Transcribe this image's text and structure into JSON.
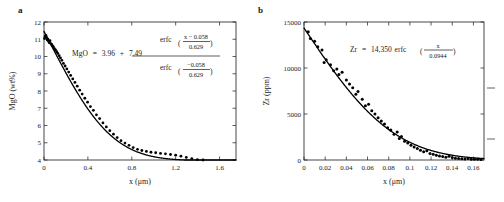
{
  "figure": {
    "background": "#ffffff",
    "foreground": "#1a1a1a"
  },
  "panels": [
    {
      "label": "a",
      "equation": {
        "lhs": "MgO",
        "equals": "=",
        "intercept": "3.96",
        "plus": "+",
        "amplitude": "7.49",
        "numerator_fn": "erfc",
        "numerator_top": "x − 0.058",
        "numerator_bottom": "0.629",
        "denominator_fn": "erfc",
        "denominator_top": "−0.058",
        "denominator_bottom": "0.629"
      }
    },
    {
      "label": "b",
      "equation": {
        "lhs": "Zr",
        "equals": "=",
        "amplitude": "14,350",
        "fn": "erfc",
        "numerator_top": "x",
        "numerator_bottom": "0.0944"
      }
    }
  ],
  "chart_data": [
    {
      "type": "scatter",
      "panel": "a",
      "title": "",
      "xlabel": "x (μm)",
      "ylabel": "MgO (wt%)",
      "xlim": [
        0,
        1.75
      ],
      "ylim": [
        4,
        12
      ],
      "xticks": [
        0,
        0.4,
        0.8,
        1.2,
        1.6
      ],
      "xticklabels": [
        "0",
        "0.4",
        "0.8",
        "1.2",
        "1.6"
      ],
      "yticks": [
        4,
        5,
        6,
        7,
        8,
        9,
        10,
        11,
        12
      ],
      "yticklabels": [
        "4",
        "5",
        "6",
        "7",
        "8",
        "9",
        "10",
        "11",
        "12"
      ],
      "grid": false,
      "legend": null,
      "annotation": "MgO = 3.96 + 7.49 erfc((x − 0.058)/0.629) / erfc(−0.058/0.629)",
      "fit": {
        "model": "erfc",
        "baseline": 3.96,
        "amplitude": 7.49,
        "x0": 0.058,
        "length_scale": 0.629
      },
      "points": [
        [
          0.005,
          11.05
        ],
        [
          0.012,
          11.18
        ],
        [
          0.018,
          11.22
        ],
        [
          0.024,
          11.1
        ],
        [
          0.03,
          10.95
        ],
        [
          0.036,
          11.0
        ],
        [
          0.042,
          10.88
        ],
        [
          0.048,
          10.8
        ],
        [
          0.055,
          10.92
        ],
        [
          0.062,
          10.75
        ],
        [
          0.07,
          10.7
        ],
        [
          0.078,
          10.62
        ],
        [
          0.086,
          10.55
        ],
        [
          0.095,
          10.45
        ],
        [
          0.105,
          10.38
        ],
        [
          0.115,
          10.28
        ],
        [
          0.126,
          10.18
        ],
        [
          0.138,
          10.05
        ],
        [
          0.15,
          9.92
        ],
        [
          0.163,
          9.78
        ],
        [
          0.177,
          9.6
        ],
        [
          0.192,
          9.45
        ],
        [
          0.208,
          9.28
        ],
        [
          0.225,
          9.1
        ],
        [
          0.243,
          8.9
        ],
        [
          0.262,
          8.7
        ],
        [
          0.282,
          8.5
        ],
        [
          0.303,
          8.28
        ],
        [
          0.325,
          8.05
        ],
        [
          0.348,
          7.82
        ],
        [
          0.372,
          7.58
        ],
        [
          0.397,
          7.35
        ],
        [
          0.423,
          7.1
        ],
        [
          0.45,
          6.88
        ],
        [
          0.478,
          6.62
        ],
        [
          0.507,
          6.4
        ],
        [
          0.537,
          6.15
        ],
        [
          0.568,
          5.92
        ],
        [
          0.6,
          5.7
        ],
        [
          0.633,
          5.5
        ],
        [
          0.667,
          5.3
        ],
        [
          0.702,
          5.12
        ],
        [
          0.738,
          4.98
        ],
        [
          0.775,
          4.85
        ],
        [
          0.813,
          4.72
        ],
        [
          0.852,
          4.62
        ],
        [
          0.892,
          4.55
        ],
        [
          0.933,
          4.5
        ],
        [
          0.975,
          4.45
        ],
        [
          1.018,
          4.42
        ],
        [
          1.062,
          4.38
        ],
        [
          1.107,
          4.36
        ],
        [
          1.153,
          4.32
        ],
        [
          1.2,
          4.28
        ],
        [
          1.248,
          4.22
        ],
        [
          1.297,
          4.15
        ],
        [
          1.347,
          4.08
        ],
        [
          1.398,
          4.02
        ],
        [
          1.45,
          4.0
        ],
        [
          1.503,
          3.97
        ],
        [
          1.557,
          3.96
        ],
        [
          1.612,
          3.94
        ],
        [
          1.668,
          3.93
        ]
      ]
    },
    {
      "type": "scatter",
      "panel": "b",
      "title": "",
      "xlabel": "x (μm)",
      "ylabel": "Zr (ppm)",
      "xlim": [
        0,
        0.17
      ],
      "ylim": [
        0,
        15000
      ],
      "xticks": [
        0,
        0.02,
        0.04,
        0.06,
        0.08,
        0.1,
        0.12,
        0.14,
        0.16
      ],
      "xticklabels": [
        "0",
        "0.02",
        "0.04",
        "0.06",
        "0.08",
        "0.1",
        "0.12",
        "0.14",
        "0.16"
      ],
      "yticks": [
        0,
        5000,
        10000,
        15000
      ],
      "yticklabels": [
        "0",
        "5000",
        "10000",
        "15000"
      ],
      "grid": false,
      "legend": null,
      "annotation": "Zr = 14,350 erfc(x/0.0944)",
      "fit": {
        "model": "erfc",
        "baseline": 0,
        "amplitude": 14350,
        "x0": 0,
        "length_scale": 0.0944
      },
      "points": [
        [
          0.004,
          13950
        ],
        [
          0.006,
          13200
        ],
        [
          0.01,
          12900
        ],
        [
          0.013,
          12300
        ],
        [
          0.017,
          11950
        ],
        [
          0.019,
          10600
        ],
        [
          0.021,
          10900
        ],
        [
          0.025,
          10350
        ],
        [
          0.028,
          9700
        ],
        [
          0.031,
          9900
        ],
        [
          0.033,
          9300
        ],
        [
          0.036,
          9550
        ],
        [
          0.04,
          8700
        ],
        [
          0.043,
          8250
        ],
        [
          0.046,
          7850
        ],
        [
          0.049,
          7150
        ],
        [
          0.051,
          7450
        ],
        [
          0.055,
          6600
        ],
        [
          0.058,
          5900
        ],
        [
          0.061,
          6050
        ],
        [
          0.064,
          5350
        ],
        [
          0.067,
          5000
        ],
        [
          0.07,
          4600
        ],
        [
          0.073,
          4250
        ],
        [
          0.076,
          3900
        ],
        [
          0.079,
          3500
        ],
        [
          0.082,
          3250
        ],
        [
          0.085,
          2800
        ],
        [
          0.088,
          3050
        ],
        [
          0.09,
          2350
        ],
        [
          0.092,
          2550
        ],
        [
          0.095,
          2050
        ],
        [
          0.098,
          1850
        ],
        [
          0.101,
          1600
        ],
        [
          0.104,
          1400
        ],
        [
          0.107,
          1250
        ],
        [
          0.11,
          1050
        ],
        [
          0.113,
          900
        ],
        [
          0.116,
          1000
        ],
        [
          0.119,
          700
        ],
        [
          0.122,
          620
        ],
        [
          0.125,
          520
        ],
        [
          0.128,
          430
        ],
        [
          0.131,
          380
        ],
        [
          0.134,
          300
        ],
        [
          0.137,
          420
        ],
        [
          0.14,
          260
        ],
        [
          0.143,
          200
        ],
        [
          0.146,
          170
        ],
        [
          0.149,
          140
        ],
        [
          0.152,
          110
        ],
        [
          0.155,
          170
        ],
        [
          0.158,
          90
        ],
        [
          0.161,
          80
        ],
        [
          0.164,
          70
        ],
        [
          0.167,
          60
        ]
      ]
    }
  ]
}
